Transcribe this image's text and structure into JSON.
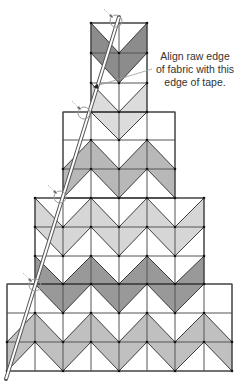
{
  "callout": {
    "lines": [
      "Align raw edge",
      "of fabric with this",
      "edge of tape."
    ],
    "leader": {
      "from": [
        152,
        69
      ],
      "to": [
        93,
        87
      ]
    }
  },
  "grid": {
    "col_edges": [
      7,
      35,
      63,
      91,
      119,
      147,
      175,
      204,
      232
    ],
    "row_edges": [
      23,
      53,
      83,
      112,
      140,
      169,
      198,
      227,
      256,
      284,
      313,
      342,
      371
    ],
    "line_color": "#2a2a2a",
    "blocks": [
      {
        "name": "top-block",
        "cols": [
          3,
          4
        ],
        "rows": [
          0,
          2
        ]
      },
      {
        "name": "second-block",
        "cols": [
          2,
          5
        ],
        "rows": [
          3,
          5
        ]
      },
      {
        "name": "third-block",
        "cols": [
          1,
          6
        ],
        "rows": [
          6,
          8
        ]
      },
      {
        "name": "bottom-block",
        "cols": [
          0,
          7
        ],
        "rows": [
          9,
          11
        ]
      }
    ],
    "shading_rows": [
      {
        "row": 0,
        "type": "lower",
        "cols": [
          3,
          4
        ],
        "color": "#8c8c8c"
      },
      {
        "row": 1,
        "type": "upper",
        "cols": [
          3,
          4
        ],
        "color": "#8c8c8c"
      },
      {
        "row": 2,
        "type": "lower",
        "cols": [
          3,
          4
        ],
        "color": "#dcdcdc"
      },
      {
        "row": 3,
        "type": "upper",
        "cols": [
          3,
          4
        ],
        "color": "#dcdcdc"
      },
      {
        "row": 4,
        "type": "lower",
        "cols": [
          2,
          5
        ],
        "color": "#b8b8b8"
      },
      {
        "row": 5,
        "type": "upper",
        "cols": [
          2,
          5
        ],
        "color": "#b8b8b8"
      },
      {
        "row": 6,
        "type": "lower",
        "cols": [
          1,
          6
        ],
        "color": "#d6d6d6"
      },
      {
        "row": 7,
        "type": "upper",
        "cols": [
          1,
          6
        ],
        "color": "#d6d6d6"
      },
      {
        "row": 8,
        "type": "lower",
        "cols": [
          1,
          6
        ],
        "color": "#999999"
      },
      {
        "row": 9,
        "type": "upper",
        "cols": [
          1,
          6
        ],
        "color": "#999999"
      },
      {
        "row": 10,
        "type": "lower",
        "cols": [
          0,
          7
        ],
        "color": "#c0c0c0"
      },
      {
        "row": 11,
        "type": "upper",
        "cols": [
          0,
          7
        ],
        "color": "#c0c0c0"
      }
    ]
  },
  "tape": {
    "start": [
      119,
      17
    ],
    "end": [
      6,
      379
    ],
    "color": "#555555"
  },
  "markers": [
    {
      "cx": 116,
      "cy": 21,
      "r": 6
    },
    {
      "cx": 84,
      "cy": 113,
      "r": 6
    },
    {
      "cx": 60,
      "cy": 197,
      "r": 6
    },
    {
      "cx": 35,
      "cy": 285,
      "r": 6
    }
  ],
  "marker_color": "#9a9a9a"
}
